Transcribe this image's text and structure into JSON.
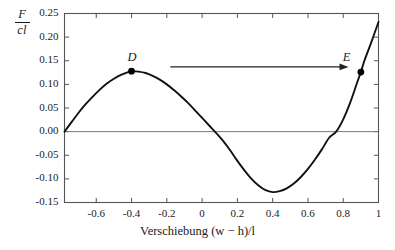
{
  "chart_data": {
    "type": "line",
    "title": "",
    "xlabel": "Verschiebung (w − h)/l",
    "ylabel": "F/cl",
    "ylabel_numerator": "F",
    "ylabel_denominator": "cl",
    "xlim": [
      -0.78,
      1.0
    ],
    "ylim": [
      -0.15,
      0.25
    ],
    "grid": false,
    "legend": "none",
    "xticks": [
      -0.6,
      -0.4,
      -0.2,
      0,
      0.2,
      0.4,
      0.6,
      0.8,
      1
    ],
    "xtick_labels": [
      "-0.6",
      "-0.4",
      "-0.2",
      "0",
      "0.2",
      "0.4",
      "0.6",
      "0.8",
      "1"
    ],
    "yticks": [
      0.25,
      0.2,
      0.15,
      0.1,
      0.05,
      0,
      -0.05,
      -0.1,
      -0.15
    ],
    "ytick_labels": [
      "0.25",
      "0.20",
      "0.15",
      "0.10",
      "0.05",
      "0.00",
      "-0.05",
      "-0.10",
      "-0.15"
    ],
    "zero_line": 0.0,
    "series": [
      {
        "name": "F/cl curve",
        "x": [
          -0.78,
          -0.74,
          -0.7,
          -0.66,
          -0.62,
          -0.58,
          -0.54,
          -0.5,
          -0.46,
          -0.42,
          -0.4,
          -0.36,
          -0.32,
          -0.28,
          -0.24,
          -0.2,
          -0.16,
          -0.12,
          -0.08,
          -0.04,
          0.0,
          0.04,
          0.08,
          0.12,
          0.16,
          0.2,
          0.24,
          0.28,
          0.32,
          0.36,
          0.4,
          0.44,
          0.48,
          0.52,
          0.56,
          0.6,
          0.64,
          0.68,
          0.72,
          0.76,
          0.8,
          0.84,
          0.88,
          0.9,
          0.92,
          0.96,
          1.0
        ],
        "y": [
          0.0,
          0.02,
          0.04,
          0.058,
          0.074,
          0.089,
          0.102,
          0.112,
          0.12,
          0.126,
          0.128,
          0.127,
          0.124,
          0.118,
          0.11,
          0.1,
          0.088,
          0.075,
          0.061,
          0.045,
          0.029,
          0.013,
          -0.003,
          -0.02,
          -0.04,
          -0.062,
          -0.082,
          -0.1,
          -0.114,
          -0.124,
          -0.128,
          -0.126,
          -0.12,
          -0.11,
          -0.096,
          -0.079,
          -0.059,
          -0.037,
          -0.013,
          0.0,
          0.026,
          0.062,
          0.105,
          0.126,
          0.15,
          0.19,
          0.232
        ]
      }
    ],
    "points": [
      {
        "label": "D",
        "x": -0.4,
        "y": 0.128,
        "label_offset": "above"
      },
      {
        "label": "E",
        "x": 0.9,
        "y": 0.126,
        "label_offset": "above-left"
      }
    ],
    "annotations": [
      {
        "type": "arrow",
        "name": "transition-arrow-D-to-E",
        "from_x": -0.18,
        "from_y": 0.137,
        "to_x": 0.83,
        "to_y": 0.137
      }
    ],
    "colors": {
      "curve": "#111111",
      "axis": "#555555",
      "zero_line": "#777777",
      "point": "#000000",
      "arrow": "#222222",
      "background": "#ffffff",
      "text": "#1a1a1a"
    }
  }
}
